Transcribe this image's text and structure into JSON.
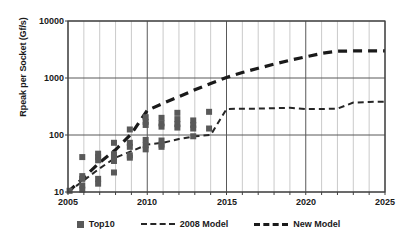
{
  "chart_data": {
    "type": "scatter",
    "title": "",
    "xlabel": "",
    "ylabel": "Rpeak per Socket (Gf/s)",
    "xlim": [
      2005,
      2025
    ],
    "ylim": [
      10,
      10000
    ],
    "yscale": "log",
    "grid": true,
    "legend_position": "bottom",
    "x_ticks": [
      "2005",
      "2010",
      "2015",
      "2020",
      "2025"
    ],
    "y_ticks": [
      "10",
      "100",
      "1000",
      "10000"
    ],
    "legend": [
      "Top10",
      "2008 Model",
      "New Model"
    ],
    "series": [
      {
        "name": "Top10",
        "type": "scatter",
        "marker": "square",
        "color": "#595959",
        "points": [
          {
            "x": 2005.1,
            "y": 10.5
          },
          {
            "x": 2005.9,
            "y": 41
          },
          {
            "x": 2005.9,
            "y": 19
          },
          {
            "x": 2005.9,
            "y": 17
          },
          {
            "x": 2005.9,
            "y": 13
          },
          {
            "x": 2005.9,
            "y": 11
          },
          {
            "x": 2006.9,
            "y": 47
          },
          {
            "x": 2006.9,
            "y": 41
          },
          {
            "x": 2006.9,
            "y": 36
          },
          {
            "x": 2006.9,
            "y": 17
          },
          {
            "x": 2006.9,
            "y": 14
          },
          {
            "x": 2007.9,
            "y": 73
          },
          {
            "x": 2007.9,
            "y": 46
          },
          {
            "x": 2007.9,
            "y": 41
          },
          {
            "x": 2007.9,
            "y": 35
          },
          {
            "x": 2007.9,
            "y": 22
          },
          {
            "x": 2008.9,
            "y": 125
          },
          {
            "x": 2008.9,
            "y": 73
          },
          {
            "x": 2008.9,
            "y": 62
          },
          {
            "x": 2008.9,
            "y": 44
          },
          {
            "x": 2008.9,
            "y": 40
          },
          {
            "x": 2009.9,
            "y": 205
          },
          {
            "x": 2009.9,
            "y": 170
          },
          {
            "x": 2009.9,
            "y": 150
          },
          {
            "x": 2009.9,
            "y": 82
          },
          {
            "x": 2009.9,
            "y": 66
          },
          {
            "x": 2009.9,
            "y": 56
          },
          {
            "x": 2010.9,
            "y": 200
          },
          {
            "x": 2010.9,
            "y": 160
          },
          {
            "x": 2010.9,
            "y": 140
          },
          {
            "x": 2010.9,
            "y": 80
          },
          {
            "x": 2010.9,
            "y": 68
          },
          {
            "x": 2010.9,
            "y": 62
          },
          {
            "x": 2011.9,
            "y": 245
          },
          {
            "x": 2011.9,
            "y": 190
          },
          {
            "x": 2011.9,
            "y": 155
          },
          {
            "x": 2011.9,
            "y": 135
          },
          {
            "x": 2012.9,
            "y": 180
          },
          {
            "x": 2012.9,
            "y": 150
          },
          {
            "x": 2012.9,
            "y": 130
          },
          {
            "x": 2012.9,
            "y": 95
          },
          {
            "x": 2013.9,
            "y": 255
          },
          {
            "x": 2013.9,
            "y": 130
          }
        ]
      },
      {
        "name": "2008 Model",
        "type": "line",
        "style": "dashed-thin",
        "color": "#262626",
        "points": [
          {
            "x": 2005.0,
            "y": 10
          },
          {
            "x": 2006.0,
            "y": 16
          },
          {
            "x": 2007.0,
            "y": 26
          },
          {
            "x": 2008.0,
            "y": 40
          },
          {
            "x": 2009.0,
            "y": 52
          },
          {
            "x": 2010.0,
            "y": 68
          },
          {
            "x": 2011.0,
            "y": 73
          },
          {
            "x": 2012.0,
            "y": 85
          },
          {
            "x": 2013.0,
            "y": 95
          },
          {
            "x": 2014.0,
            "y": 100
          },
          {
            "x": 2015.0,
            "y": 285
          },
          {
            "x": 2016.0,
            "y": 290
          },
          {
            "x": 2017.0,
            "y": 290
          },
          {
            "x": 2018.0,
            "y": 295
          },
          {
            "x": 2019.0,
            "y": 300
          },
          {
            "x": 2020.0,
            "y": 285
          },
          {
            "x": 2021.0,
            "y": 285
          },
          {
            "x": 2022.0,
            "y": 290
          },
          {
            "x": 2023.0,
            "y": 370
          },
          {
            "x": 2024.0,
            "y": 380
          },
          {
            "x": 2025.0,
            "y": 385
          }
        ]
      },
      {
        "name": "New Model",
        "type": "line",
        "style": "dashed-thick",
        "color": "#1a1a1a",
        "points": [
          {
            "x": 2005.0,
            "y": 10
          },
          {
            "x": 2006.0,
            "y": 18
          },
          {
            "x": 2007.0,
            "y": 33
          },
          {
            "x": 2008.0,
            "y": 55
          },
          {
            "x": 2009.0,
            "y": 105
          },
          {
            "x": 2010.0,
            "y": 270
          },
          {
            "x": 2011.0,
            "y": 360
          },
          {
            "x": 2012.0,
            "y": 470
          },
          {
            "x": 2013.0,
            "y": 620
          },
          {
            "x": 2014.0,
            "y": 800
          },
          {
            "x": 2015.0,
            "y": 1020
          },
          {
            "x": 2016.0,
            "y": 1250
          },
          {
            "x": 2017.0,
            "y": 1480
          },
          {
            "x": 2018.0,
            "y": 1750
          },
          {
            "x": 2019.0,
            "y": 2050
          },
          {
            "x": 2020.0,
            "y": 2350
          },
          {
            "x": 2021.0,
            "y": 2700
          },
          {
            "x": 2022.0,
            "y": 2950
          },
          {
            "x": 2023.0,
            "y": 2980
          },
          {
            "x": 2024.0,
            "y": 2980
          },
          {
            "x": 2025.0,
            "y": 2980
          }
        ]
      }
    ]
  },
  "axes": {
    "y_label": "Rpeak per Socket (Gf/s)",
    "y_ticks": [
      "10000",
      "1000",
      "100",
      "10"
    ],
    "x_ticks": [
      "2005",
      "2010",
      "2015",
      "2020",
      "2025"
    ]
  },
  "legend": {
    "top10": "Top10",
    "model2008": "2008 Model",
    "new_model": "New Model"
  },
  "colors": {
    "marker": "#595959",
    "line_thin": "#262626",
    "line_thick": "#1a1a1a",
    "grid_minor": "#b3b3b3",
    "grid_major": "#595959",
    "axis": "#404040"
  }
}
